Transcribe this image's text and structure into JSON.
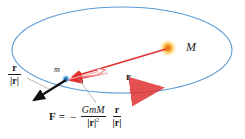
{
  "figure": {
    "background_color": "#ffffff",
    "width": 245,
    "height": 139
  },
  "colors": {
    "orbit": "#5b9bd5",
    "orbit_light": "#9dc3e6",
    "vector_red": "#e03131",
    "arrow_pink": "#f08080",
    "arrow_pink_pale": "#f7b8b8",
    "mass_core": "#f39200",
    "mass_glow": "#fbd46d",
    "small_mass": "#3f8fd0",
    "black_arrow": "#111111",
    "leader_line": "#9a9a9a",
    "text": "#1b1b1b"
  },
  "labels": {
    "big_mass": "M",
    "small_mass": "m",
    "position_vector": "r",
    "unit_vector_numerator": "r",
    "unit_vector_denominator": "|r|"
  },
  "formula": {
    "force_symbol": "F",
    "equals": "=",
    "minus": "−",
    "numerator": "GmM",
    "denominator": "|r|",
    "denominator_exponent": "2",
    "unit_numerator": "r",
    "unit_denominator": "|r|",
    "plain_text": "F = − GmM/|r|² · r/|r|"
  },
  "geometry": {
    "orbit_center_x": 122,
    "orbit_center_y": 50,
    "orbit_radius_x": 110,
    "orbit_radius_y": 43,
    "big_mass_x": 168,
    "big_mass_y": 48,
    "small_mass_x": 66,
    "small_mass_y": 79,
    "velocity_arrow_x": 150,
    "velocity_arrow_y": 90
  },
  "elements": {
    "orbit_name": "elliptical-orbit",
    "position_vector_name": "position-vector-r",
    "force_arrow_name": "force-arrow",
    "unit_arrow_name": "unit-vector-arrow",
    "velocity_arrow_name": "velocity-arrow",
    "black_arrow_name": "unit-vector-black-arrow"
  }
}
